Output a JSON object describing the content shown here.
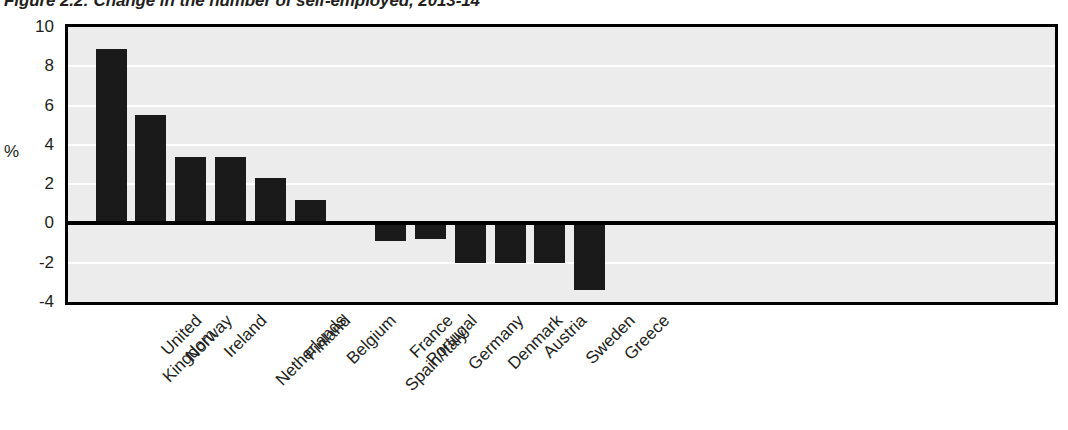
{
  "figure": {
    "title": "Figure 2.2: Change in the number of self-employed, 2013-14",
    "y_unit_label": "%"
  },
  "chart_data": {
    "type": "bar",
    "title": "Figure 2.2: Change in the number of self-employed, 2013-14",
    "xlabel": "",
    "ylabel": "%",
    "ylim": [
      -4,
      10
    ],
    "yticks": [
      10,
      8,
      6,
      4,
      2,
      0,
      -2,
      -4
    ],
    "ytick_labels": [
      "10",
      "8",
      "6",
      "4",
      "2",
      "0",
      "-2",
      "-4"
    ],
    "grid": true,
    "grid_orientation": "horizontal",
    "legend": false,
    "bar_color": "#1a1a1a",
    "plot_background": "#ececec",
    "categories": [
      "United Kingdom",
      "Norway",
      "Ireland",
      "Netherlands",
      "Finland",
      "Belgium",
      "France Spain/Italy",
      "Portugal",
      "Germany",
      "Denmark",
      "Austria",
      "Sweden",
      "Greece"
    ],
    "category_lines": [
      [
        "United",
        "Kingdom"
      ],
      [
        "Norway",
        ""
      ],
      [
        "Ireland",
        ""
      ],
      [
        "Netherlands",
        ""
      ],
      [
        "Finland",
        ""
      ],
      [
        "Belgium",
        ""
      ],
      [
        "France",
        "Spain/Italy"
      ],
      [
        "Portugal",
        ""
      ],
      [
        "Germany",
        ""
      ],
      [
        "Denmark",
        ""
      ],
      [
        "Austria",
        ""
      ],
      [
        "Sweden",
        ""
      ],
      [
        "Greece",
        ""
      ]
    ],
    "values": [
      8.9,
      5.5,
      3.4,
      3.4,
      2.3,
      1.2,
      0,
      -0.9,
      -0.8,
      -2.0,
      -2.0,
      -2.0,
      -3.4
    ]
  }
}
